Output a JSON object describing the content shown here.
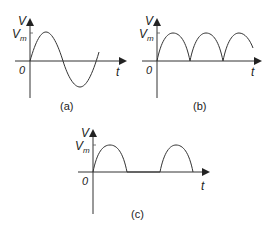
{
  "panels": [
    {
      "id": "a",
      "caption": "(a)",
      "y_label": "V",
      "amplitude_label": "V",
      "amplitude_sub": "m",
      "origin_label": "0",
      "x_label": "t",
      "waveform": "full sine wave"
    },
    {
      "id": "b",
      "caption": "(b)",
      "y_label": "V",
      "amplitude_label": "V",
      "amplitude_sub": "m",
      "origin_label": "0",
      "x_label": "t",
      "waveform": "full-wave rectified sine"
    },
    {
      "id": "c",
      "caption": "(c)",
      "y_label": "V",
      "amplitude_label": "V",
      "amplitude_sub": "m",
      "origin_label": "0",
      "x_label": "t",
      "waveform": "half-wave rectified sine"
    }
  ],
  "colors": {
    "stroke": "#333333",
    "background": "#ffffff"
  }
}
